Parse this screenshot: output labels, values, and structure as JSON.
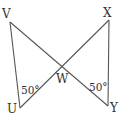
{
  "diagram": {
    "type": "two-triangles-vertical-angles",
    "colors": {
      "line": "#555555",
      "text": "#333333",
      "background": "#ffffff"
    },
    "points": {
      "V": {
        "label": "V",
        "x": 10,
        "y": 22
      },
      "X": {
        "label": "X",
        "x": 109,
        "y": 20
      },
      "U": {
        "label": "U",
        "x": 20,
        "y": 108
      },
      "Y": {
        "label": "Y",
        "x": 108,
        "y": 106
      },
      "W": {
        "label": "W",
        "x": 61,
        "y": 68
      }
    },
    "segments": [
      [
        "V",
        "U"
      ],
      [
        "V",
        "Y"
      ],
      [
        "X",
        "U"
      ],
      [
        "X",
        "Y"
      ]
    ],
    "angles": [
      {
        "vertex": "U",
        "label": "50°"
      },
      {
        "vertex": "Y",
        "label": "50°"
      }
    ]
  }
}
